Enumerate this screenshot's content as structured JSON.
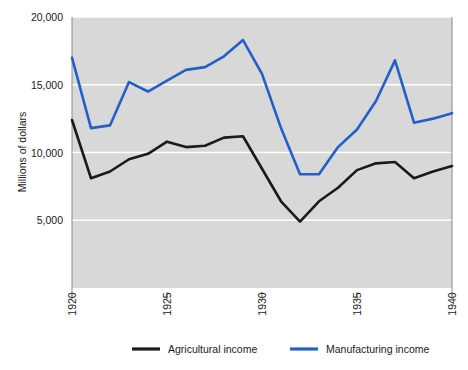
{
  "chart_data": {
    "type": "line",
    "title": "",
    "xlabel": "",
    "ylabel": "Millions of dollars",
    "xlim": [
      1920,
      1940
    ],
    "ylim": [
      0,
      20000
    ],
    "grid": true,
    "legend_position": "bottom",
    "x": [
      1920,
      1921,
      1922,
      1923,
      1924,
      1925,
      1926,
      1927,
      1928,
      1929,
      1930,
      1931,
      1932,
      1933,
      1934,
      1935,
      1936,
      1937,
      1938,
      1939,
      1940
    ],
    "xticks": [
      "1920",
      "1925",
      "1930",
      "1935",
      "1940"
    ],
    "xtick_values": [
      1920,
      1925,
      1930,
      1935,
      1940
    ],
    "yticks": [
      "5,000",
      "10,000",
      "15,000",
      "20,000"
    ],
    "ytick_values": [
      5000,
      10000,
      15000,
      20000
    ],
    "series": [
      {
        "name": "Agricultural income",
        "color": "#1a1a1a",
        "values": [
          12400,
          8100,
          8600,
          9500,
          9900,
          10800,
          10400,
          10500,
          11100,
          11200,
          8800,
          6400,
          4900,
          6400,
          7400,
          8700,
          9200,
          9300,
          8100,
          8600,
          9000
        ]
      },
      {
        "name": "Manufacturing income",
        "color": "#2060c8",
        "values": [
          17000,
          11800,
          12000,
          15200,
          14500,
          15300,
          16100,
          16300,
          17100,
          18300,
          15800,
          11800,
          8400,
          8400,
          10400,
          11700,
          13800,
          16800,
          12200,
          12500,
          12900
        ]
      }
    ]
  },
  "legend": {
    "items": [
      {
        "label": "Agricultural income",
        "color": "#1a1a1a"
      },
      {
        "label": "Manufacturing income",
        "color": "#2060c8"
      }
    ]
  },
  "axes": {
    "y_axis_title": "Millions of dollars"
  },
  "style": {
    "plot_background": "#d8d8d8",
    "gridline_color": "#ffffff",
    "page_background": "#ffffff",
    "axis_color": "#808080"
  }
}
